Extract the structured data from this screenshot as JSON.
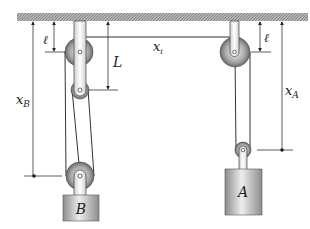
{
  "diagram": {
    "type": "pulley-system",
    "labels": {
      "ell_left": "ℓ",
      "ell_right": "ℓ",
      "L": "L",
      "x_i": "x",
      "x_i_sub": "i",
      "x_B": "x",
      "x_B_sub": "B",
      "x_A": "x",
      "x_A_sub": "A",
      "block_B": "B",
      "block_A": "A"
    },
    "colors": {
      "ceiling": "#9a9a9a",
      "line": "#333333",
      "pulley_light": "#d8d8d8",
      "pulley_dark": "#6a6a6a",
      "block_light": "#e6e6e6",
      "block_dark": "#8a8a8a"
    }
  }
}
